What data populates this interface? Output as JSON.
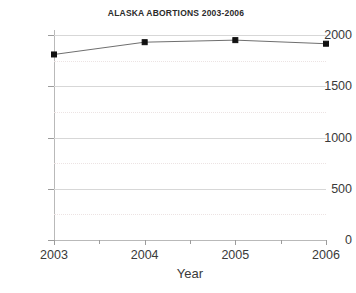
{
  "chart_data": {
    "type": "line",
    "title": "ALASKA ABORTIONS 2003-2006",
    "xlabel": "Year",
    "ylabel": "",
    "categories": [
      "2003",
      "2004",
      "2005",
      "2006"
    ],
    "x": [
      2003,
      2004,
      2005,
      2006
    ],
    "values": [
      1810,
      1930,
      1950,
      1915
    ],
    "series": [
      {
        "name": "Alaska abortions",
        "values": [
          1810,
          1930,
          1950,
          1915
        ]
      }
    ],
    "ylim": [
      0,
      2000
    ],
    "xlim": [
      2003,
      2006
    ],
    "y_ticks": [
      0,
      500,
      1000,
      1500,
      2000
    ],
    "y_tick_labels": [
      "0",
      "500",
      "1000",
      "1500",
      "2000"
    ],
    "y_minor_ticks": [
      250,
      750,
      1250,
      1750
    ],
    "x_ticks": [
      2003,
      2004,
      2005,
      2006
    ],
    "x_tick_labels": [
      "2003",
      "2004",
      "2005",
      "2006"
    ],
    "grid": "horizontal-major-solid-minor-dotted",
    "legend": "none",
    "marker": "filled-square",
    "colors": {
      "line": "#6f6f6f",
      "marker": "#111111",
      "major_grid": "#d7d7d7",
      "minor_grid": "#ece3e3",
      "axis": "#b9b9b9",
      "text": "#3a3a3a",
      "background": "#ffffff"
    }
  }
}
